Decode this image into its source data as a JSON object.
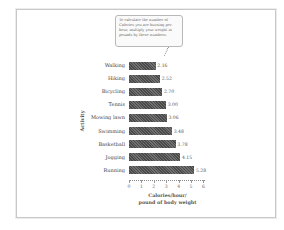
{
  "callout": {
    "text": "To calculate the number of Calories you are burning per hour, multiply your weight in pounds by these numbers."
  },
  "axis": {
    "ylabel": "Activity",
    "xlabel_line1": "Calories/hour/",
    "xlabel_line2": "pound of body weight",
    "ticks": [
      "0",
      "1",
      "2",
      "3",
      "4",
      "5",
      "6"
    ]
  },
  "colors": {
    "bar": "#5a5a5a",
    "frame": "#c8c8c8"
  },
  "chart_data": {
    "type": "bar",
    "orientation": "horizontal",
    "title": "",
    "annotation": "To calculate the number of Calories you are burning per hour, multiply your weight in pounds by these numbers.",
    "categories": [
      "Walking",
      "Hiking",
      "Bicycling",
      "Tennis",
      "Mowing lawn",
      "Swimming",
      "Basketball",
      "Jogging",
      "Running"
    ],
    "values": [
      2.16,
      2.52,
      2.7,
      3.0,
      3.06,
      3.48,
      3.78,
      4.15,
      5.28
    ],
    "value_labels": [
      "2.16",
      "2.52",
      "2.70",
      "3.00",
      "3.06",
      "3.48",
      "3.78",
      "4.15",
      "5.28"
    ],
    "xlabel": "Calories/hour/pound of body weight",
    "ylabel": "Activity",
    "xlim": [
      0,
      6
    ],
    "xticks": [
      0,
      1,
      2,
      3,
      4,
      5,
      6
    ],
    "grid": false,
    "legend": null
  }
}
